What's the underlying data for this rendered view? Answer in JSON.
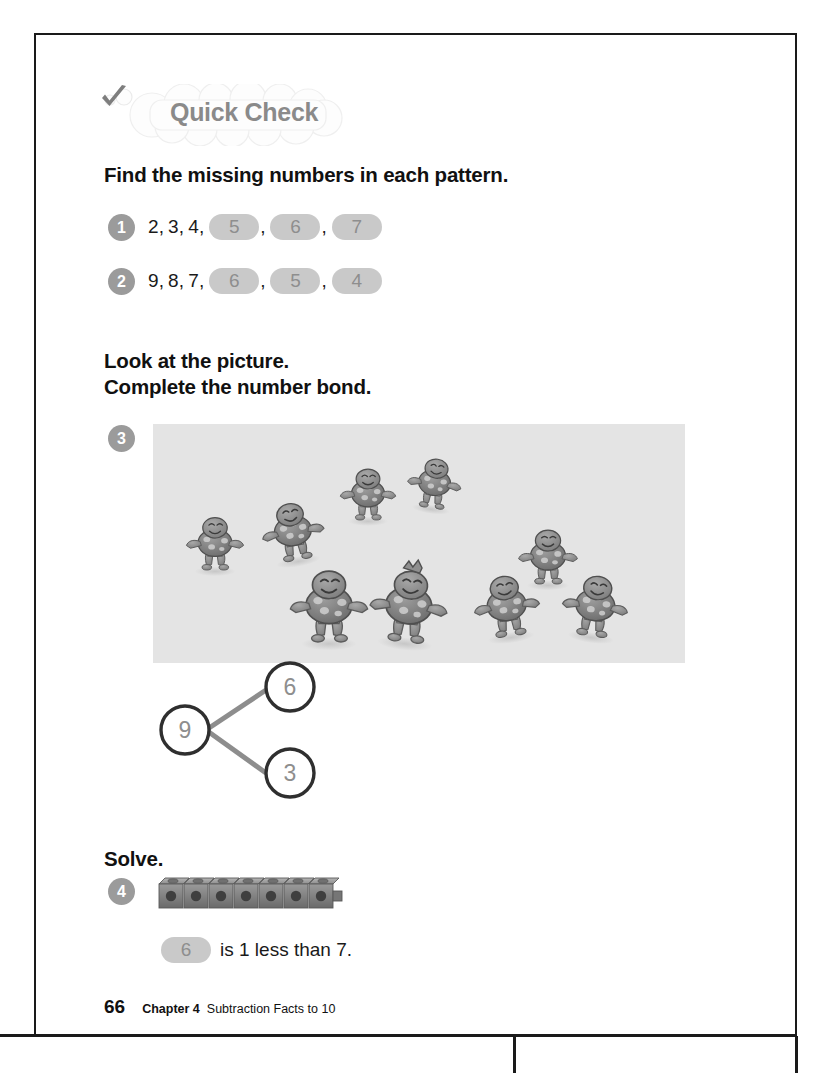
{
  "banner": {
    "label": "Quick Check",
    "icon": "check-mark-icon",
    "text_color": "#8a8a8a"
  },
  "instructions": {
    "patterns": "Find the missing numbers in each pattern.",
    "picture": "Look at the picture.\nComplete the number bond.",
    "solve": "Solve."
  },
  "exercises": [
    {
      "number": "1",
      "given": [
        "2",
        "3",
        "4"
      ],
      "answers": [
        "5",
        "6",
        "7"
      ]
    },
    {
      "number": "2",
      "given": [
        "9",
        "8",
        "7"
      ],
      "answers": [
        "6",
        "5",
        "4"
      ]
    },
    {
      "number": "3",
      "picture_alt": "turtles-dancing-illustration"
    },
    {
      "number": "4",
      "manipulative": "seven-linking-cubes"
    }
  ],
  "number_bond": {
    "whole": "9",
    "part_top": "6",
    "part_bottom": "3"
  },
  "solve_statement": {
    "answer": "6",
    "text": "is 1 less than 7."
  },
  "picture_counts": {
    "left_group": 6,
    "right_group": 3
  },
  "footer": {
    "page_number": "66",
    "chapter": "Chapter 4",
    "chapter_title": "Subtraction Facts to 10"
  },
  "colors": {
    "badge": "#9b9b9b",
    "answer_blank_bg": "#c9c9c9",
    "answer_blank_text": "#8e8e8e",
    "picture_bg": "#e4e4e4",
    "bond_stroke": "#2f2f2f"
  }
}
